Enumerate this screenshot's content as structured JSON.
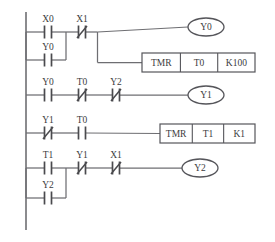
{
  "diagram": {
    "type": "ladder-logic",
    "background_color": "#ffffff",
    "line_color": "#6e6e72",
    "text_color": "#3c3c40",
    "rail": {
      "name": "left-power-rail",
      "x": 26,
      "y_top": 12,
      "y_bottom": 230
    }
  },
  "rungs": [
    {
      "index": 1,
      "name": "rung-1",
      "contacts": [
        {
          "label": "X0",
          "type": "NO",
          "name": "contact-x0",
          "x": 48,
          "y": 32
        },
        {
          "label": "Y0",
          "type": "NO",
          "name": "contact-y0-branch",
          "x": 48,
          "y": 60
        },
        {
          "label": "X1",
          "type": "NC",
          "name": "contact-x1",
          "x": 82,
          "y": 32
        }
      ],
      "branch": {
        "name": "parallel-branch-x0-y0",
        "x_left": 26,
        "x_right": 66,
        "y_top": 32,
        "y_bottom": 60
      },
      "outputs": [
        {
          "kind": "coil",
          "label": "Y0",
          "name": "coil-y0",
          "cx": 206,
          "cy": 27
        },
        {
          "kind": "box",
          "name": "instruction-tmr-t0",
          "cells": [
            "TMR",
            "T0",
            "K100"
          ],
          "x": 142,
          "y": 53,
          "w": 113,
          "h": 19
        }
      ]
    },
    {
      "index": 2,
      "name": "rung-2",
      "contacts": [
        {
          "label": "Y0",
          "type": "NO",
          "name": "contact-y0",
          "x": 48,
          "y": 95
        },
        {
          "label": "T0",
          "type": "NC",
          "name": "contact-t0-nc",
          "x": 82,
          "y": 95
        },
        {
          "label": "Y2",
          "type": "NC",
          "name": "contact-y2-nc",
          "x": 116,
          "y": 95
        }
      ],
      "outputs": [
        {
          "kind": "coil",
          "label": "Y1",
          "name": "coil-y1",
          "cx": 206,
          "cy": 95
        }
      ]
    },
    {
      "index": 3,
      "name": "rung-3",
      "contacts": [
        {
          "label": "Y1",
          "type": "NC",
          "name": "contact-y1-nc",
          "x": 48,
          "y": 133
        },
        {
          "label": "T0",
          "type": "NO",
          "name": "contact-t0-no",
          "x": 82,
          "y": 133
        }
      ],
      "outputs": [
        {
          "kind": "box",
          "name": "instruction-tmr-t1",
          "cells": [
            "TMR",
            "T1",
            "K1"
          ],
          "x": 160,
          "y": 124,
          "w": 95,
          "h": 19
        }
      ]
    },
    {
      "index": 4,
      "name": "rung-4",
      "contacts": [
        {
          "label": "T1",
          "type": "NO",
          "name": "contact-t1",
          "x": 48,
          "y": 168
        },
        {
          "label": "Y2",
          "type": "NO",
          "name": "contact-y2-branch",
          "x": 48,
          "y": 198
        },
        {
          "label": "Y1",
          "type": "NC",
          "name": "contact-y1-nc-2",
          "x": 82,
          "y": 168
        },
        {
          "label": "X1",
          "type": "NC",
          "name": "contact-x1-nc-2",
          "x": 116,
          "y": 168
        }
      ],
      "branch": {
        "name": "parallel-branch-t1-y2",
        "x_left": 26,
        "x_right": 66,
        "y_top": 168,
        "y_bottom": 198
      },
      "outputs": [
        {
          "kind": "coil",
          "label": "Y2",
          "name": "coil-y2",
          "cx": 200,
          "cy": 168
        }
      ]
    }
  ]
}
